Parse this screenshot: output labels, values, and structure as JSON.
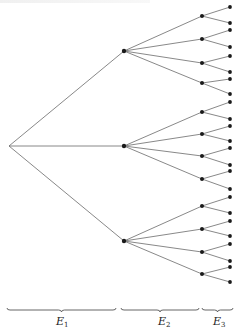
{
  "diagram": {
    "type": "tree",
    "colors": {
      "edge": "#6a6a6a",
      "node": "#1a1a1a",
      "brace": "#555555",
      "label": "#222222"
    },
    "root": {
      "x": 9,
      "y": 146
    },
    "level1": [
      {
        "x": 124,
        "y": 51
      },
      {
        "x": 124,
        "y": 146
      },
      {
        "x": 124,
        "y": 241
      }
    ],
    "level2": [
      {
        "parent": 0,
        "x": 202,
        "y": 16
      },
      {
        "parent": 0,
        "x": 202,
        "y": 39
      },
      {
        "parent": 0,
        "x": 202,
        "y": 63
      },
      {
        "parent": 0,
        "x": 202,
        "y": 83
      },
      {
        "parent": 1,
        "x": 202,
        "y": 112
      },
      {
        "parent": 1,
        "x": 202,
        "y": 134
      },
      {
        "parent": 1,
        "x": 202,
        "y": 156
      },
      {
        "parent": 1,
        "x": 202,
        "y": 179
      },
      {
        "parent": 2,
        "x": 202,
        "y": 206
      },
      {
        "parent": 2,
        "x": 202,
        "y": 229
      },
      {
        "parent": 2,
        "x": 202,
        "y": 252
      },
      {
        "parent": 2,
        "x": 202,
        "y": 274
      }
    ],
    "leaves": [
      {
        "parent": 0,
        "x": 230,
        "y": 7
      },
      {
        "parent": 0,
        "x": 230,
        "y": 23
      },
      {
        "parent": 1,
        "x": 230,
        "y": 30
      },
      {
        "parent": 1,
        "x": 230,
        "y": 47
      },
      {
        "parent": 2,
        "x": 230,
        "y": 56
      },
      {
        "parent": 2,
        "x": 230,
        "y": 72
      },
      {
        "parent": 3,
        "x": 230,
        "y": 79
      },
      {
        "parent": 3,
        "x": 230,
        "y": 94
      },
      {
        "parent": 4,
        "x": 230,
        "y": 102
      },
      {
        "parent": 4,
        "x": 230,
        "y": 119
      },
      {
        "parent": 5,
        "x": 230,
        "y": 126
      },
      {
        "parent": 5,
        "x": 230,
        "y": 141
      },
      {
        "parent": 6,
        "x": 230,
        "y": 148
      },
      {
        "parent": 6,
        "x": 230,
        "y": 165
      },
      {
        "parent": 7,
        "x": 230,
        "y": 171
      },
      {
        "parent": 7,
        "x": 230,
        "y": 189
      },
      {
        "parent": 8,
        "x": 230,
        "y": 197
      },
      {
        "parent": 8,
        "x": 230,
        "y": 213
      },
      {
        "parent": 9,
        "x": 230,
        "y": 221
      },
      {
        "parent": 9,
        "x": 230,
        "y": 236
      },
      {
        "parent": 10,
        "x": 230,
        "y": 244
      },
      {
        "parent": 10,
        "x": 230,
        "y": 261
      },
      {
        "parent": 11,
        "x": 230,
        "y": 267
      },
      {
        "parent": 11,
        "x": 230,
        "y": 282
      }
    ],
    "braces": [
      {
        "name": "E1",
        "x1": 7,
        "x2": 116,
        "y": 308,
        "label": "E",
        "subscript": "1"
      },
      {
        "name": "E2",
        "x1": 121,
        "x2": 199,
        "y": 308,
        "label": "E",
        "subscript": "2"
      },
      {
        "name": "E3",
        "x1": 202,
        "x2": 233,
        "y": 308,
        "label": "E",
        "subscript": "3"
      }
    ]
  },
  "labels": {
    "e1": {
      "main": "E",
      "sub": "1"
    },
    "e2": {
      "main": "E",
      "sub": "2"
    },
    "e3": {
      "main": "E",
      "sub": "3"
    }
  }
}
